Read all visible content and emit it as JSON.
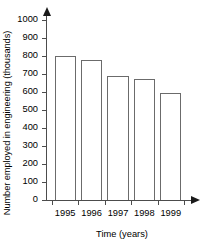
{
  "chart_data": {
    "type": "bar",
    "title": "",
    "xlabel": "Time (years)",
    "ylabel": "Number employed in engineering (thousands)",
    "categories": [
      "1995",
      "1996",
      "1997",
      "1998",
      "1999"
    ],
    "values": [
      800,
      780,
      690,
      670,
      595
    ],
    "ylim": [
      0,
      1000
    ],
    "yticks": [
      0,
      100,
      200,
      300,
      400,
      500,
      600,
      700,
      800,
      900,
      1000
    ],
    "ytick_labels": [
      "0",
      "100",
      "200",
      "300",
      "400",
      "500",
      "600",
      "700",
      "800",
      "900",
      "1000"
    ],
    "grid": false,
    "legend": null,
    "bar_fill_color": "#ffffff",
    "bar_edge_color": "#6b6b6b",
    "axis_color": "#4c4c4c"
  },
  "axes": {
    "y_title": "Number employed in engineering (thousands)",
    "x_title": "Time (years)"
  }
}
